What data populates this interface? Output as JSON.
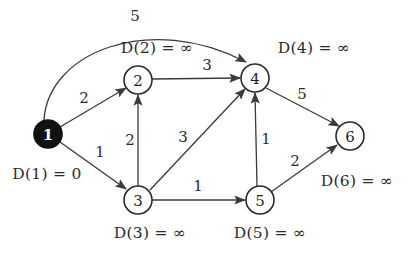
{
  "figure": {
    "type": "directed-weighted-graph",
    "background_color": "#ffffff",
    "stroke_color": "#3a3a3a",
    "source_node_fill": "#111111"
  },
  "nodes": [
    {
      "id": "1",
      "label": "1",
      "x": 48,
      "y": 134,
      "r": 14,
      "filled": true,
      "distance_label": "D(1) = 0",
      "distance_label_x": 47,
      "distance_label_y": 174
    },
    {
      "id": "2",
      "label": "2",
      "x": 138,
      "y": 80,
      "r": 14,
      "filled": false,
      "distance_label": "D(2) = ∞",
      "distance_label_x": 157,
      "distance_label_y": 48
    },
    {
      "id": "3",
      "label": "3",
      "x": 138,
      "y": 200,
      "r": 14,
      "filled": false,
      "distance_label": "D(3) = ∞",
      "distance_label_x": 150,
      "distance_label_y": 233
    },
    {
      "id": "4",
      "label": "4",
      "x": 255,
      "y": 78,
      "r": 14,
      "filled": false,
      "distance_label": "D(4) = ∞",
      "distance_label_x": 314,
      "distance_label_y": 48
    },
    {
      "id": "5",
      "label": "5",
      "x": 260,
      "y": 200,
      "r": 14,
      "filled": false,
      "distance_label": "D(5) = ∞",
      "distance_label_x": 270,
      "distance_label_y": 233
    },
    {
      "id": "6",
      "label": "6",
      "x": 350,
      "y": 136,
      "r": 14,
      "filled": false,
      "distance_label": "D(6) = ∞",
      "distance_label_x": 357,
      "distance_label_y": 181
    }
  ],
  "edges": [
    {
      "from": "1",
      "to": "4",
      "weight": "5",
      "shape": "curve",
      "path": "M 44 120 C 48 52 150 12 246 62",
      "label_x": 135,
      "label_y": 16
    },
    {
      "from": "1",
      "to": "2",
      "weight": "2",
      "shape": "line",
      "path": "M 60 127 L 126 88",
      "label_x": 84,
      "label_y": 98
    },
    {
      "from": "1",
      "to": "3",
      "weight": "1",
      "shape": "line",
      "path": "M 60 142 L 126 189",
      "label_x": 100,
      "label_y": 152
    },
    {
      "from": "3",
      "to": "2",
      "weight": "2",
      "shape": "line",
      "path": "M 138 186 L 138 95",
      "label_x": 130,
      "label_y": 140
    },
    {
      "from": "2",
      "to": "4",
      "weight": "3",
      "shape": "line",
      "path": "M 152 79 L 240 78",
      "label_x": 207,
      "label_y": 65
    },
    {
      "from": "3",
      "to": "4",
      "weight": "3",
      "shape": "line",
      "path": "M 150 190 L 245 89",
      "label_x": 183,
      "label_y": 137
    },
    {
      "from": "3",
      "to": "5",
      "weight": "1",
      "shape": "line",
      "path": "M 152 200 L 245 200",
      "label_x": 198,
      "label_y": 186
    },
    {
      "from": "5",
      "to": "4",
      "weight": "1",
      "shape": "line",
      "path": "M 257 186 L 255 93",
      "label_x": 266,
      "label_y": 139
    },
    {
      "from": "4",
      "to": "6",
      "weight": "5",
      "shape": "line",
      "path": "M 266 88 L 339 126",
      "label_x": 302,
      "label_y": 94
    },
    {
      "from": "5",
      "to": "6",
      "weight": "2",
      "shape": "line",
      "path": "M 271 192 L 337 145",
      "label_x": 295,
      "label_y": 161
    }
  ]
}
